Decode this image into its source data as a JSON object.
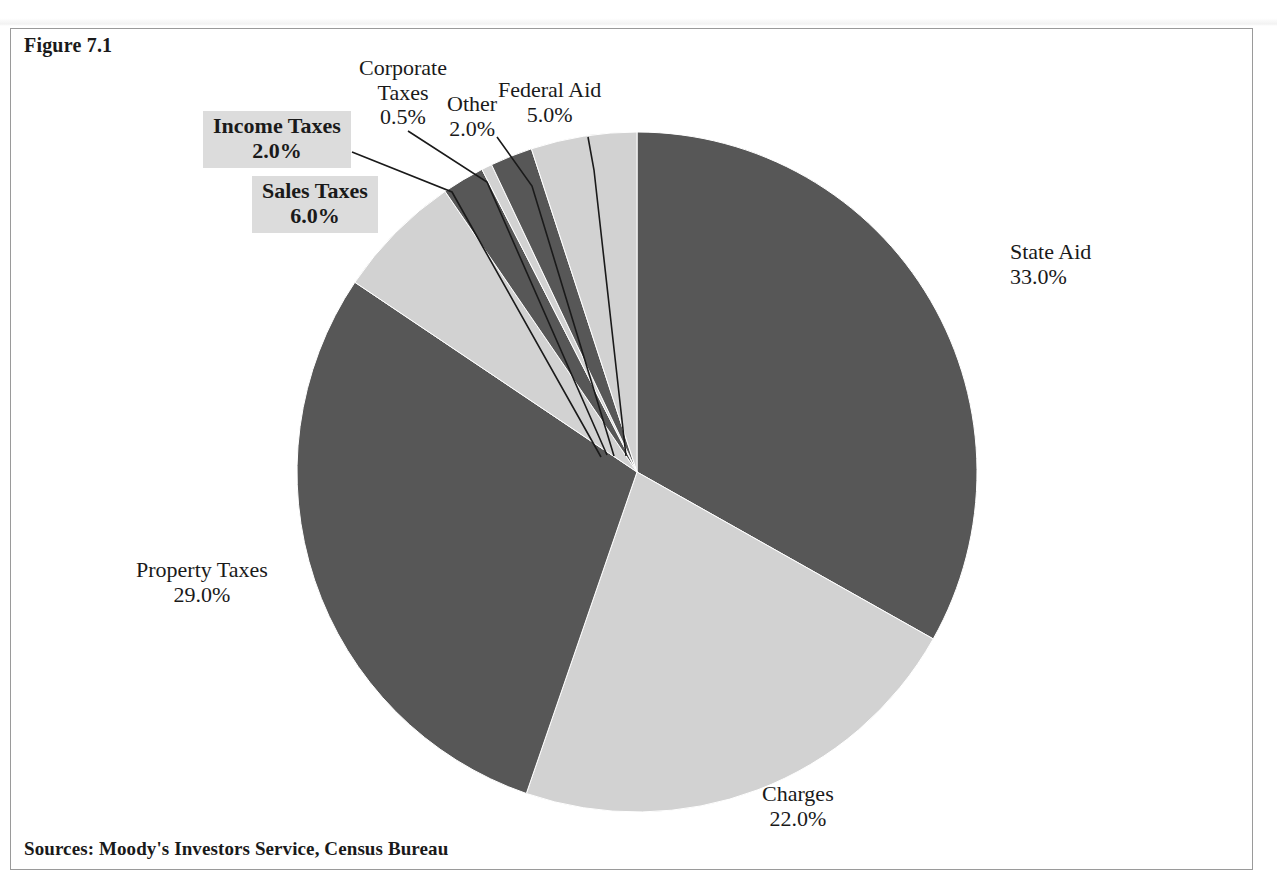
{
  "figure": {
    "number_label": "Figure 7.1",
    "sources_note": "Sources: Moody's Investors Service, Census Bureau"
  },
  "colors": {
    "dark_slice": "#575757",
    "light_slice": "#d2d2d2",
    "slice_outline": "#ffffff",
    "frame_border": "#9a9a9a",
    "highlight_box": "#dcdcdc",
    "text": "#1a1a1a"
  },
  "chart_data": {
    "type": "pie",
    "title": "Figure 7.1",
    "xlabel": "",
    "ylabel": "",
    "units": "percent",
    "start_angle_deg": 0,
    "direction": "clockwise",
    "legend": "none",
    "grid": false,
    "annotations": [
      "Sources: Moody's Investors Service, Census Bureau"
    ],
    "categories": [
      "State Aid",
      "Charges",
      "Property Taxes",
      "Sales Taxes",
      "Income Taxes",
      "Corporate Taxes",
      "Other",
      "Federal Aid"
    ],
    "values": [
      33.0,
      22.0,
      29.0,
      6.0,
      2.0,
      0.5,
      2.0,
      5.0
    ],
    "slices": [
      {
        "name": "State Aid",
        "value": 33.0,
        "value_label": "33.0%",
        "shade": "dark",
        "highlight": false
      },
      {
        "name": "Charges",
        "value": 22.0,
        "value_label": "22.0%",
        "shade": "light",
        "highlight": false
      },
      {
        "name": "Property Taxes",
        "value": 29.0,
        "value_label": "29.0%",
        "shade": "dark",
        "highlight": false
      },
      {
        "name": "Sales Taxes",
        "value": 6.0,
        "value_label": "6.0%",
        "shade": "light",
        "highlight": true
      },
      {
        "name": "Income Taxes",
        "value": 2.0,
        "value_label": "2.0%",
        "shade": "dark",
        "highlight": true
      },
      {
        "name": "Corporate Taxes",
        "value": 0.5,
        "value_label": "0.5%",
        "shade": "light",
        "highlight": false
      },
      {
        "name": "Other",
        "value": 2.0,
        "value_label": "2.0%",
        "shade": "dark",
        "highlight": false
      },
      {
        "name": "Federal Aid",
        "value": 5.0,
        "value_label": "5.0%",
        "shade": "light",
        "highlight": false
      }
    ]
  },
  "labels": {
    "state_aid": {
      "name": "State Aid",
      "value": "33.0%"
    },
    "charges": {
      "name": "Charges",
      "value": "22.0%"
    },
    "property_taxes": {
      "name": "Property Taxes",
      "value": "29.0%"
    },
    "sales_taxes": {
      "name": "Sales Taxes",
      "value": "6.0%"
    },
    "income_taxes": {
      "name": "Income Taxes",
      "value": "2.0%"
    },
    "corporate_taxes": {
      "name": "Corporate",
      "name2": "Taxes",
      "value": "0.5%"
    },
    "other": {
      "name": "Other",
      "value": "2.0%"
    },
    "federal_aid": {
      "name": "Federal Aid",
      "value": "5.0%"
    }
  }
}
